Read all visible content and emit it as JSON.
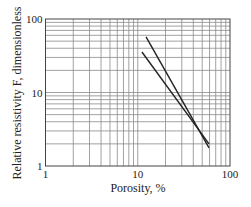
{
  "chart_data": {
    "type": "line",
    "title": "",
    "xlabel": "Porosity, %",
    "ylabel": "Relative resistivity F, dimensionless",
    "xscale": "log",
    "yscale": "log",
    "xlim": [
      1,
      100
    ],
    "ylim": [
      1,
      100
    ],
    "xticks": [
      "1",
      "10",
      "100"
    ],
    "yticks": [
      "1",
      "10",
      "100"
    ],
    "grid": true,
    "legend": null,
    "series": [
      {
        "name": "line-steep",
        "color": "#222222",
        "x": [
          12.3,
          59.2
        ],
        "y": [
          57,
          1.76
        ]
      },
      {
        "name": "line-shallow",
        "color": "#222222",
        "x": [
          11.1,
          59.2
        ],
        "y": [
          35.6,
          2.0
        ]
      }
    ]
  },
  "colors": {
    "grid": "#8a8a8a",
    "frame": "#444444",
    "line": "#222222",
    "text": "#222222"
  }
}
